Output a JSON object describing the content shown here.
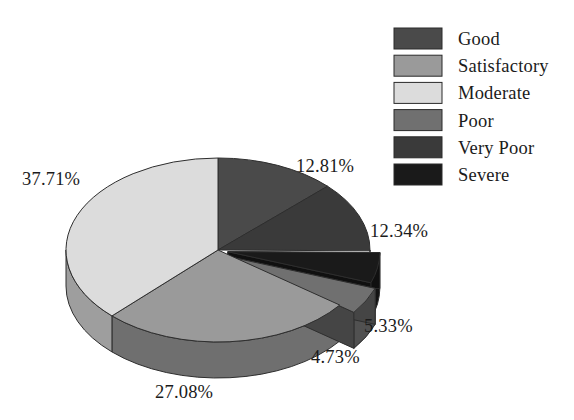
{
  "chart_data": {
    "type": "pie",
    "title": "",
    "subtitle": "",
    "xlabel": "",
    "ylabel": "",
    "grid": false,
    "three_d": true,
    "start_angle_deg": 0,
    "direction": "clockwise",
    "legend_position": "top-right",
    "categories": [
      "Good",
      "Satisfactory",
      "Moderate",
      "Poor",
      "Very Poor",
      "Severe"
    ],
    "values": [
      12.81,
      27.08,
      37.71,
      4.73,
      12.34,
      5.33
    ],
    "value_unit": "%",
    "slice_colors": [
      "#4a4a4a",
      "#9a9a9a",
      "#dcdcdc",
      "#707070",
      "#3a3a3a",
      "#1a1a1a"
    ],
    "data_labels": [
      "12.81%",
      "27.08%",
      "37.71%",
      "4.73%",
      "12.34%",
      "5.33%"
    ],
    "slices": [
      {
        "label": "Good",
        "value": 12.81,
        "text": "12.81%",
        "color": "#4a4a4a"
      },
      {
        "label": "Very Poor",
        "value": 12.34,
        "text": "12.34%",
        "color": "#3a3a3a"
      },
      {
        "label": "Severe",
        "value": 5.33,
        "text": "5.33%",
        "color": "#1a1a1a"
      },
      {
        "label": "Poor",
        "value": 4.73,
        "text": "4.73%",
        "color": "#707070"
      },
      {
        "label": "Satisfactory",
        "value": 27.08,
        "text": "27.08%",
        "color": "#9a9a9a"
      },
      {
        "label": "Moderate",
        "value": 37.71,
        "text": "37.71%",
        "color": "#dcdcdc"
      }
    ]
  },
  "legend": {
    "items": [
      {
        "label": "Good",
        "color": "#4a4a4a"
      },
      {
        "label": "Satisfactory",
        "color": "#9a9a9a"
      },
      {
        "label": "Moderate",
        "color": "#dcdcdc"
      },
      {
        "label": "Poor",
        "color": "#707070"
      },
      {
        "label": "Very Poor",
        "color": "#3a3a3a"
      },
      {
        "label": "Severe",
        "color": "#1a1a1a"
      }
    ]
  },
  "labels": {
    "good_pct": "12.81%",
    "very_poor_pct": "12.34%",
    "severe_pct": "5.33%",
    "poor_pct": "4.73%",
    "satisfactory_pct": "27.08%",
    "moderate_pct": "37.71%"
  },
  "colors": {
    "background": "#ffffff",
    "text": "#1b1b1b",
    "outline": "#2e2e2e"
  }
}
